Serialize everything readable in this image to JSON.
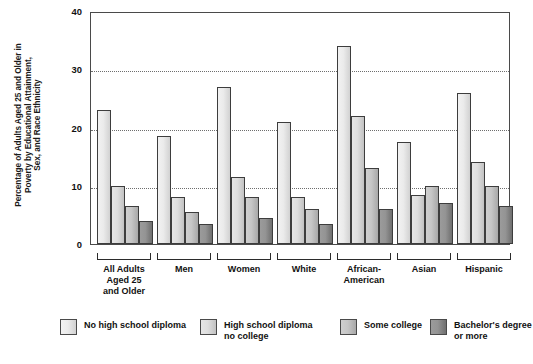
{
  "chart_data": {
    "type": "bar",
    "title": "",
    "xlabel": "",
    "ylabel": "Percentage of Adults Aged 25 and Older in Poverty by Educational Attainment, Sex, and Race Ethnicity",
    "ylabel_lines": [
      "Percentage of Adults Aged 25 and Older in",
      "Poverty by Educational Attainment,",
      "Sex, and Race Ethnicity"
    ],
    "ylim": [
      0,
      40
    ],
    "yticks": [
      0,
      10,
      20,
      30,
      40
    ],
    "ytick_labels": [
      "0",
      "10",
      "20",
      "30",
      "40"
    ],
    "gridlines": [
      10,
      20,
      30
    ],
    "grid": true,
    "legend_position": "bottom",
    "categories": [
      "All Adults Aged 25 and Older",
      "Men",
      "Women",
      "White",
      "African-American",
      "Asian",
      "Hispanic"
    ],
    "category_label_lines": [
      [
        "All Adults",
        "Aged 25",
        "and Older"
      ],
      [
        "Men"
      ],
      [
        "Women"
      ],
      [
        "White"
      ],
      [
        "African-",
        "American"
      ],
      [
        "Asian"
      ],
      [
        "Hispanic"
      ]
    ],
    "series": [
      {
        "name": "No high school diploma",
        "legend_lines": [
          "No high school diploma"
        ],
        "color": "#ebebeb",
        "values": [
          23,
          18.5,
          27,
          21,
          34,
          17.5,
          26
        ]
      },
      {
        "name": "High school diploma no college",
        "legend_lines": [
          "High school diploma",
          "no college"
        ],
        "color": "#dedede",
        "values": [
          10,
          8,
          11.5,
          8,
          22,
          8.5,
          14
        ]
      },
      {
        "name": "Some college",
        "legend_lines": [
          "Some college"
        ],
        "color": "#c6c6c6",
        "values": [
          6.5,
          5.5,
          8,
          6,
          13,
          10,
          10
        ]
      },
      {
        "name": "Bachelor's degree or more",
        "legend_lines": [
          "Bachelor's degree",
          "or more"
        ],
        "color": "#949494",
        "values": [
          4,
          3.5,
          4.5,
          3.5,
          6,
          7,
          6.5
        ]
      }
    ]
  }
}
